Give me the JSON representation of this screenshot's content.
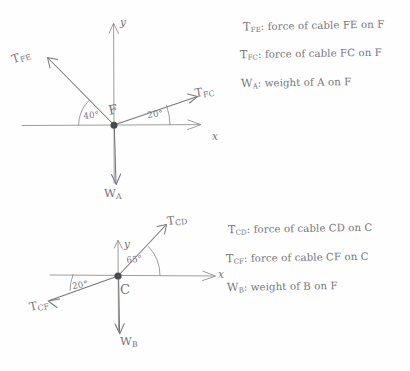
{
  "document": {
    "kind": "hand-drawn free-body diagram worksheet",
    "background_color": "#fefefe",
    "ink_color": "#77777a"
  },
  "diagram_top": {
    "origin_label": "F",
    "axis_x_label": "x",
    "axis_y_label": "y",
    "vectors": [
      {
        "name": "T_FE",
        "symbol": "T",
        "subscript": "FE",
        "label": "TFE",
        "direction": "up-left",
        "angle_from_neg_x_deg": 40
      },
      {
        "name": "T_FC",
        "symbol": "T",
        "subscript": "FC",
        "label": "TFC",
        "direction": "up-right",
        "angle_from_pos_x_deg": 20
      },
      {
        "name": "W_A",
        "symbol": "W",
        "subscript": "A",
        "label": "WA",
        "direction": "down",
        "angle_from_pos_x_deg": 270
      }
    ],
    "angles": [
      {
        "value": "40°",
        "between": "TFE and negative x-axis"
      },
      {
        "value": "20°",
        "between": "TFC and positive x-axis"
      }
    ]
  },
  "diagram_bottom": {
    "origin_label": "C",
    "axis_x_label": "x",
    "axis_y_label": "y",
    "vectors": [
      {
        "name": "T_CD",
        "symbol": "T",
        "subscript": "CD",
        "label": "TCD",
        "direction": "up-right",
        "angle_from_pos_x_deg": 65
      },
      {
        "name": "T_CF",
        "symbol": "T",
        "subscript": "CF",
        "label": "TCF",
        "direction": "down-left",
        "angle_from_neg_x_deg": 20
      },
      {
        "name": "W_B",
        "symbol": "W",
        "subscript": "B",
        "label": "WB",
        "direction": "down",
        "angle_from_pos_x_deg": 270
      }
    ],
    "angles": [
      {
        "value": "65°",
        "between": "TCD and positive x-axis"
      },
      {
        "value": "20°",
        "between": "TCF and negative x-axis"
      }
    ]
  },
  "legend_top": {
    "lines": [
      {
        "symbol": "T",
        "subscript": "FE",
        "text": ": force of cable FE on F"
      },
      {
        "symbol": "T",
        "subscript": "FC",
        "text": ": force of cable FC on F"
      },
      {
        "symbol": "W",
        "subscript": "A",
        "text": ": weight of A  on F"
      }
    ]
  },
  "legend_bottom": {
    "lines": [
      {
        "symbol": "T",
        "subscript": "CD",
        "text": ": force of cable CD on C"
      },
      {
        "symbol": "T",
        "subscript": "CF",
        "text": ": force of cable CF on C"
      },
      {
        "symbol": "W",
        "subscript": "B",
        "text": ": weight of B on F"
      }
    ]
  }
}
